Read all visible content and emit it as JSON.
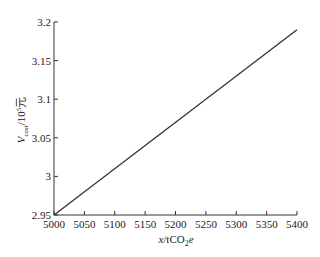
{
  "chart_data": {
    "type": "line",
    "title": "",
    "xlabel": "x/tCO2e",
    "ylabel": "V_cost/10^5 元",
    "xlim": [
      5000,
      5400
    ],
    "ylim": [
      2.95,
      3.2
    ],
    "x_ticks": [
      "5000",
      "5050",
      "5100",
      "5150",
      "5200",
      "5250",
      "5300",
      "5350",
      "5400"
    ],
    "y_ticks": [
      "2.95",
      "3",
      "3.05",
      "3.1",
      "3.15",
      "3.2"
    ],
    "grid": false,
    "legend": null,
    "series": [
      {
        "name": "V_cost",
        "x": [
          5000,
          5400
        ],
        "values": [
          2.95,
          3.19
        ]
      }
    ]
  },
  "labels": {
    "x_main": "x",
    "x_unit": "/tCO",
    "x_sub": "2",
    "x_tail": "e",
    "y_main": "V",
    "y_sub": "cost",
    "y_unit": "/10",
    "y_sup": "5",
    "y_tail": "元"
  }
}
